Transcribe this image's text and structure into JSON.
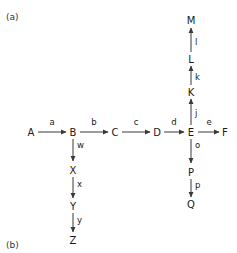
{
  "figure": {
    "panel_a_label": "(a)",
    "panel_b_label": "(b)",
    "background_color": "#ffffff",
    "stroke_color": "#3a3a3a",
    "text_color": "#1a1a1a"
  },
  "chart_data": {
    "type": "diagram",
    "title": "",
    "subtitle": "",
    "xlabel": "",
    "ylabel": "",
    "legend": [],
    "panels": [
      "(a)",
      "(b)"
    ],
    "nodes": [
      {
        "id": "A",
        "label": "A",
        "x": 31,
        "y": 132
      },
      {
        "id": "B",
        "label": "B",
        "x": 73,
        "y": 132
      },
      {
        "id": "C",
        "label": "C",
        "x": 115,
        "y": 132
      },
      {
        "id": "D",
        "label": "D",
        "x": 157,
        "y": 132
      },
      {
        "id": "E",
        "label": "E",
        "x": 191,
        "y": 132
      },
      {
        "id": "F",
        "label": "F",
        "x": 225,
        "y": 132
      },
      {
        "id": "K",
        "label": "K",
        "x": 191,
        "y": 92
      },
      {
        "id": "L",
        "label": "L",
        "x": 191,
        "y": 59
      },
      {
        "id": "M",
        "label": "M",
        "x": 191,
        "y": 20
      },
      {
        "id": "P",
        "label": "P",
        "x": 191,
        "y": 172
      },
      {
        "id": "Q",
        "label": "Q",
        "x": 191,
        "y": 204
      },
      {
        "id": "X",
        "label": "X",
        "x": 73,
        "y": 170
      },
      {
        "id": "Y",
        "label": "Y",
        "x": 73,
        "y": 206
      },
      {
        "id": "Z",
        "label": "Z",
        "x": 73,
        "y": 240
      }
    ],
    "edges": [
      {
        "from": "A",
        "to": "B",
        "label": "a",
        "direction": "right",
        "x1": 38,
        "y1": 132,
        "x2": 66,
        "y2": 132,
        "lx": 52,
        "ly": 125
      },
      {
        "from": "B",
        "to": "C",
        "label": "b",
        "direction": "right",
        "x1": 80,
        "y1": 132,
        "x2": 108,
        "y2": 132,
        "lx": 94,
        "ly": 125
      },
      {
        "from": "C",
        "to": "D",
        "label": "c",
        "direction": "right",
        "x1": 122,
        "y1": 132,
        "x2": 150,
        "y2": 132,
        "lx": 136,
        "ly": 125
      },
      {
        "from": "D",
        "to": "E",
        "label": "d",
        "direction": "right",
        "x1": 164,
        "y1": 132,
        "x2": 184,
        "y2": 132,
        "lx": 174,
        "ly": 125
      },
      {
        "from": "E",
        "to": "F",
        "label": "e",
        "direction": "right",
        "x1": 198,
        "y1": 132,
        "x2": 219,
        "y2": 132,
        "lx": 209,
        "ly": 125
      },
      {
        "from": "E",
        "to": "K",
        "label": "j",
        "direction": "up",
        "x1": 191,
        "y1": 125,
        "x2": 191,
        "y2": 99,
        "lx": 195,
        "ly": 116
      },
      {
        "from": "K",
        "to": "L",
        "label": "k",
        "direction": "up",
        "x1": 191,
        "y1": 85,
        "x2": 191,
        "y2": 66,
        "lx": 195,
        "ly": 80
      },
      {
        "from": "L",
        "to": "M",
        "label": "l",
        "direction": "up",
        "x1": 191,
        "y1": 52,
        "x2": 191,
        "y2": 28,
        "lx": 195,
        "ly": 45
      },
      {
        "from": "E",
        "to": "P",
        "label": "o",
        "direction": "down",
        "x1": 191,
        "y1": 139,
        "x2": 191,
        "y2": 163,
        "lx": 195,
        "ly": 148
      },
      {
        "from": "P",
        "to": "Q",
        "label": "p",
        "direction": "down",
        "x1": 191,
        "y1": 179,
        "x2": 191,
        "y2": 197,
        "lx": 195,
        "ly": 188
      },
      {
        "from": "B",
        "to": "X",
        "label": "w",
        "direction": "down",
        "x1": 73,
        "y1": 139,
        "x2": 73,
        "y2": 161,
        "lx": 77,
        "ly": 148
      },
      {
        "from": "X",
        "to": "Y",
        "label": "x",
        "direction": "down",
        "x1": 73,
        "y1": 177,
        "x2": 73,
        "y2": 198,
        "lx": 77,
        "ly": 187
      },
      {
        "from": "Y",
        "to": "Z",
        "label": "y",
        "direction": "down",
        "x1": 73,
        "y1": 213,
        "x2": 73,
        "y2": 232,
        "lx": 77,
        "ly": 223
      }
    ],
    "chains": [
      {
        "name": "main-horizontal",
        "sequence": [
          "A",
          "B",
          "C",
          "D",
          "E",
          "F"
        ],
        "edge_labels": [
          "a",
          "b",
          "c",
          "d",
          "e"
        ]
      },
      {
        "name": "E-upward-branch",
        "sequence": [
          "E",
          "K",
          "L",
          "M"
        ],
        "edge_labels": [
          "j",
          "k",
          "l"
        ]
      },
      {
        "name": "E-downward-branch",
        "sequence": [
          "E",
          "P",
          "Q"
        ],
        "edge_labels": [
          "o",
          "p"
        ]
      },
      {
        "name": "B-downward-branch",
        "sequence": [
          "B",
          "X",
          "Y",
          "Z"
        ],
        "edge_labels": [
          "w",
          "x",
          "y"
        ]
      }
    ]
  }
}
